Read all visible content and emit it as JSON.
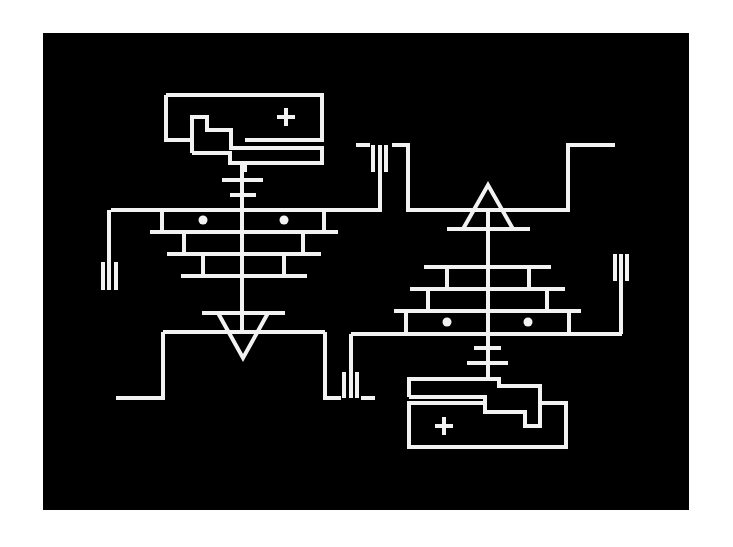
{
  "figure": {
    "background_color": "#ffffff",
    "panel_color": "#000000",
    "line_color": "#f2f2f2"
  },
  "left_figure": {
    "battery_outer": "M166,95 L322,95 L322,140 L245,140",
    "battery_inner": "M192,140 L166,140 L166,95 M192,153 L192,117 L207,117 L207,130 L231,130 L231,140 M231,140 L231,148 L322,148 L322,163 L245,163 L245,170 L242,170",
    "battery_inner2": "M192,153 L230,153 L230,163 L245,163",
    "plus": {
      "cx": 286,
      "cy": 117,
      "label": "+"
    },
    "stem": "M242,163 L242,332",
    "stem_bars": [
      "M222,180 L263,180",
      "M230,195 L256,195"
    ],
    "pyramid": [
      "M111,210 L382,210",
      "M162,210 L162,232",
      "M324,210 L324,232",
      "M150,232 L338,232",
      "M184,232 L184,254",
      "M303,232 L303,254",
      "M167,254 L321,254",
      "M203,254 L203,276",
      "M284,254 L284,276",
      "M181,276 L307,276"
    ],
    "dots": [
      {
        "cx": 203,
        "cy": 220
      },
      {
        "cx": 284,
        "cy": 220
      }
    ],
    "triangle": "M202,313 L285,313 M218,313 L243,358 L268,313",
    "wires": [
      "M109,210 L109,262",
      "M163,332 L325,332",
      "M163,332 L163,398 L116,398",
      "M325,332 L325,398 L341,398",
      "M361,398 L375,398"
    ],
    "terminal_left": [
      "M103,262 L103,290",
      "M109,262 L109,290",
      "M116,262 L116,290"
    ],
    "terminal_bottom": [
      "M344,372 L344,398",
      "M351,334 L351,398",
      "M357,372 L357,398"
    ],
    "terminal_top": [
      "M373,145 L373,172",
      "M380,145 L380,210",
      "M386,145 L386,172"
    ]
  },
  "right_figure": {
    "top_wire": "M356,145 L370,145 M392,145 L408,145 L408,210 L568,210 L568,145 L615,145",
    "triangle": "M447,229 L530,229 M463,229 L488,185 L513,229",
    "stem": "M488,210 L488,378",
    "pyramid": [
      "M424,267 L551,267",
      "M447,267 L447,289",
      "M529,267 L529,289",
      "M410,289 L565,289",
      "M428,289 L428,311",
      "M547,289 L547,311",
      "M394,311 L581,311",
      "M406,311 L406,334",
      "M569,311 L569,334",
      "M351,334 L622,334"
    ],
    "dots": [
      {
        "cx": 447,
        "cy": 322
      },
      {
        "cx": 528,
        "cy": 322
      }
    ],
    "stem_bars": [
      "M474,348 L501,348",
      "M467,363 L508,363"
    ],
    "terminal_right": [
      "M615,254 L615,281",
      "M621,254 L621,334",
      "M627,254 L627,281"
    ],
    "battery_upper": "M409,397 L409,379 L499,379 L499,386 L540,386 L540,426 L525,426 L525,412 L485,412 L485,397 L409,397",
    "battery_outer": "M485,403 L409,403 L409,447 L566,447 L566,403 L540,403",
    "plus": {
      "cx": 444,
      "cy": 426,
      "label": "+"
    }
  }
}
